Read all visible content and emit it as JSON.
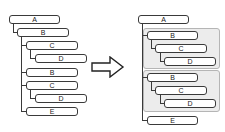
{
  "before": {
    "nodes": [
      {
        "label": "A"
      },
      {
        "label": "B"
      },
      {
        "label": "C"
      },
      {
        "label": "D"
      },
      {
        "label": "B"
      },
      {
        "label": "C"
      },
      {
        "label": "D"
      },
      {
        "label": "E"
      }
    ]
  },
  "arrow": {
    "direction": "right"
  },
  "after": {
    "nodes": [
      {
        "label": "A"
      },
      {
        "label": "B"
      },
      {
        "label": "C"
      },
      {
        "label": "D"
      },
      {
        "label": "B"
      },
      {
        "label": "C"
      },
      {
        "label": "D"
      },
      {
        "label": "E"
      }
    ],
    "groups": [
      {
        "name": "group-1",
        "members": [
          "B",
          "C",
          "D"
        ]
      },
      {
        "name": "group-2",
        "members": [
          "B",
          "C",
          "D"
        ]
      }
    ]
  }
}
